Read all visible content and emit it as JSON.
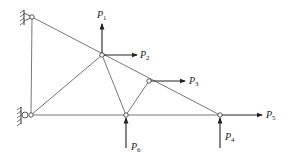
{
  "diagram": {
    "type": "truss",
    "nodes": {
      "support_top": {
        "x": 32,
        "y": 17,
        "kind": "pin"
      },
      "support_bottom": {
        "x": 31,
        "y": 115,
        "kind": "roller"
      },
      "node_p2": {
        "x": 102,
        "y": 55
      },
      "node_p3": {
        "x": 149,
        "y": 81
      },
      "node_p6": {
        "x": 126,
        "y": 115
      },
      "node_p4p5": {
        "x": 220,
        "y": 115
      }
    },
    "loads": [
      {
        "label": "P",
        "sub": "1",
        "direction": "up",
        "node": "node_p2"
      },
      {
        "label": "P",
        "sub": "2",
        "direction": "right",
        "node": "node_p2"
      },
      {
        "label": "P",
        "sub": "3",
        "direction": "right",
        "node": "node_p3"
      },
      {
        "label": "P",
        "sub": "4",
        "direction": "up",
        "node": "node_p4p5"
      },
      {
        "label": "P",
        "sub": "5",
        "direction": "right",
        "node": "node_p4p5"
      },
      {
        "label": "P",
        "sub": "6",
        "direction": "up",
        "node": "node_p6"
      }
    ],
    "colors": {
      "line": "#444444",
      "arrow": "#222222",
      "text": "#222222"
    }
  }
}
